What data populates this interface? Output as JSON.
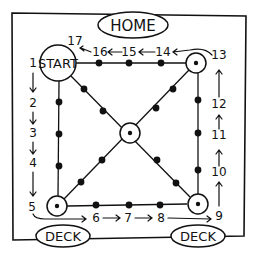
{
  "labels": {
    "home": "HOME",
    "start": "START",
    "deck_left": "DECK",
    "deck_right": "DECK"
  },
  "path_numbers": {
    "n1": "1",
    "n2": "2",
    "n3": "3",
    "n4": "4",
    "n5": "5",
    "n6": "6",
    "n7": "7",
    "n8": "8",
    "n9": "9",
    "n10": "10",
    "n11": "11",
    "n12": "12",
    "n13": "13",
    "n14": "14",
    "n15": "15",
    "n16": "16",
    "n17": "17"
  },
  "colors": {
    "ink": "#111111",
    "background": "#ffffff"
  }
}
